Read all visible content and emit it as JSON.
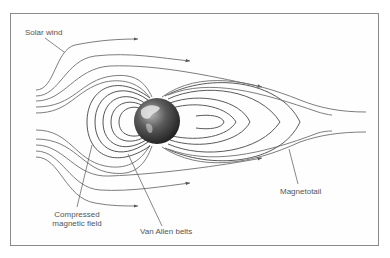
{
  "diagram": {
    "type": "magnetosphere",
    "labels": {
      "solar_wind": "Solar wind",
      "compressed_line1": "Compressed",
      "compressed_line2": "magnetic field",
      "van_allen": "Van Allen belts",
      "magnetotail": "Magnetotail"
    },
    "colors": {
      "line": "#6e6e6e",
      "frame": "#8a8a8a",
      "text": "#555555",
      "earth_dark": "#2a2a2a",
      "earth_light": "#9a9a9a"
    }
  }
}
